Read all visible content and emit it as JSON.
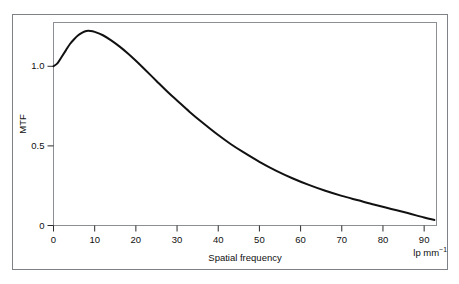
{
  "chart_data": {
    "type": "line",
    "title": "",
    "subtitle": "",
    "xlabel": "Spatial frequency",
    "xunit": "lp mm",
    "xunit_exponent": "−1",
    "ylabel": "MTF",
    "xlim": [
      0,
      93
    ],
    "ylim": [
      0,
      1.275
    ],
    "grid": false,
    "legend": null,
    "xticks": [
      0,
      10,
      20,
      30,
      40,
      50,
      60,
      70,
      80,
      90
    ],
    "xtick_labels": [
      "0",
      "10",
      "20",
      "30",
      "40",
      "50",
      "60",
      "70",
      "80",
      "90"
    ],
    "yticks": [
      0,
      0.5,
      1.0
    ],
    "ytick_labels": [
      "0",
      "0.5",
      "1.0"
    ],
    "series": [
      {
        "name": "MTF",
        "color": "#111111",
        "line_width": 2,
        "x": [
          0,
          1,
          2,
          3,
          4,
          5,
          6,
          7,
          8,
          9,
          10,
          12,
          14,
          16,
          18,
          20,
          22,
          25,
          28,
          30,
          33,
          36,
          40,
          43,
          46,
          50,
          54,
          58,
          62,
          66,
          70,
          74,
          78,
          82,
          86,
          90,
          92.5
        ],
        "y": [
          1.0,
          1.02,
          1.06,
          1.1,
          1.14,
          1.17,
          1.195,
          1.212,
          1.222,
          1.222,
          1.216,
          1.195,
          1.163,
          1.125,
          1.082,
          1.035,
          0.985,
          0.908,
          0.832,
          0.785,
          0.715,
          0.65,
          0.568,
          0.512,
          0.462,
          0.4,
          0.345,
          0.297,
          0.255,
          0.218,
          0.186,
          0.158,
          0.13,
          0.104,
          0.078,
          0.05,
          0.035
        ]
      }
    ]
  },
  "caption": {
    "text": ""
  }
}
